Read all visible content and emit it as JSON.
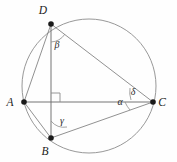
{
  "figure": {
    "background_color": "#fefefe",
    "stroke_color": "#8c8c8c",
    "vertex_color": "#1b1b1b",
    "canvas": {
      "width": 177,
      "height": 162
    }
  },
  "circle": {
    "name": "circumcircle",
    "cx": 89,
    "cy": 86,
    "r": 67
  },
  "vertices": [
    {
      "id": "A",
      "label": "A",
      "x": 24,
      "y": 102,
      "label_x": 10,
      "label_y": 106
    },
    {
      "id": "B",
      "label": "B",
      "x": 51,
      "y": 138,
      "label_x": 45,
      "label_y": 155
    },
    {
      "id": "C",
      "label": "C",
      "x": 153,
      "y": 102,
      "label_x": 160,
      "label_y": 106
    },
    {
      "id": "D",
      "label": "D",
      "x": 51,
      "y": 24,
      "label_x": 43,
      "label_y": 14
    }
  ],
  "segments": [
    {
      "id": "AC",
      "from": "A",
      "to": "C",
      "x1": 24,
      "y1": 102,
      "x2": 153,
      "y2": 102
    },
    {
      "id": "DB",
      "from": "D",
      "to": "B",
      "x1": 51,
      "y1": 24,
      "x2": 51,
      "y2": 138
    },
    {
      "id": "AD",
      "from": "A",
      "to": "D",
      "x1": 24,
      "y1": 102,
      "x2": 51,
      "y2": 24
    },
    {
      "id": "DC",
      "from": "D",
      "to": "C",
      "x1": 51,
      "y1": 24,
      "x2": 153,
      "y2": 102
    },
    {
      "id": "AB",
      "from": "A",
      "to": "B",
      "x1": 24,
      "y1": 102,
      "x2": 51,
      "y2": 138
    },
    {
      "id": "BC",
      "from": "B",
      "to": "C",
      "x1": 51,
      "y1": 138,
      "x2": 153,
      "y2": 102
    }
  ],
  "angles": [
    {
      "id": "beta",
      "label": "β",
      "at_vertex": "D",
      "label_x": 57,
      "label_y": 48
    },
    {
      "id": "gamma",
      "label": "γ",
      "at_vertex": "B",
      "label_x": 62,
      "label_y": 124
    },
    {
      "id": "alpha",
      "label": "α",
      "at_vertex": "C",
      "label_x": 120,
      "label_y": 105
    },
    {
      "id": "delta",
      "label": "δ",
      "at_vertex": "C",
      "label_x": 133,
      "label_y": 95
    }
  ],
  "right_angle": {
    "id": "right-angle-marker",
    "label": "90 degrees",
    "x": 51,
    "y": 102,
    "size": 9
  }
}
